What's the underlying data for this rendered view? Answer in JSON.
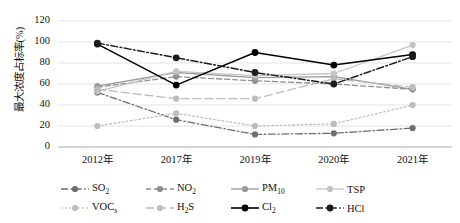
{
  "chart_data": {
    "type": "line",
    "title": "",
    "xlabel": "",
    "ylabel": "最大浓度占标率(%)",
    "categories": [
      "2012年",
      "2017年",
      "2019年",
      "2020年",
      "2021年"
    ],
    "ylim": [
      0,
      120
    ],
    "yticks": [
      0,
      20,
      40,
      60,
      80,
      100,
      120
    ],
    "grid": true,
    "legend_position": "bottom",
    "series": [
      {
        "name": "SO2",
        "label_html": "SO<sub>2</sub>",
        "color": "#6f6f6f",
        "line_style": "dash-dot",
        "values": [
          52,
          26,
          12,
          13,
          18
        ]
      },
      {
        "name": "NO2",
        "label_html": "NO<sub>2</sub>",
        "color": "#8f8f8f",
        "line_style": "dashed",
        "values": [
          57,
          67,
          63,
          60,
          55
        ]
      },
      {
        "name": "PM10",
        "label_html": "PM<sub>10</sub>",
        "color": "#9a9a9a",
        "line_style": "solid",
        "values": [
          58,
          71,
          66,
          67,
          55
        ]
      },
      {
        "name": "TSP",
        "label_html": "TSP",
        "color": "#c4c4c4",
        "line_style": "solid",
        "values": [
          53,
          72,
          68,
          70,
          97
        ]
      },
      {
        "name": "VOCs",
        "label_html": "VOC<sub>s</sub>",
        "color": "#bdbdbd",
        "line_style": "dotted",
        "values": [
          20,
          32,
          20,
          22,
          40
        ]
      },
      {
        "name": "H2S",
        "label_html": "H<sub>2</sub>S",
        "color": "#bcbcbc",
        "line_style": "dashed-long",
        "values": [
          55,
          46,
          46,
          65,
          57
        ]
      },
      {
        "name": "Cl2",
        "label_html": "Cl<sub>2</sub>",
        "color": "#000000",
        "line_style": "solid",
        "values": [
          98,
          59,
          90,
          78,
          88
        ]
      },
      {
        "name": "HCl",
        "label_html": "HCl",
        "color": "#1c1c1c",
        "line_style": "dash-dot",
        "values": [
          99,
          85,
          71,
          60,
          86
        ]
      }
    ]
  },
  "axis": {
    "y_tick_labels": [
      "120",
      "100",
      "80",
      "60",
      "40",
      "20",
      "0"
    ],
    "y_axis_title": "最大浓度占标率(%)"
  },
  "legend": {
    "row1": [
      "SO2",
      "NO2",
      "PM10",
      "TSP"
    ],
    "row2": [
      "VOCs",
      "H2S",
      "Cl2",
      "HCl"
    ]
  }
}
